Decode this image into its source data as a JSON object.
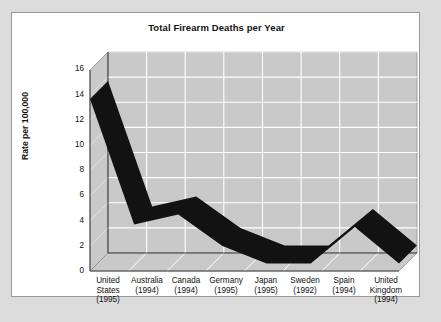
{
  "chart_data": {
    "type": "area",
    "title": "Total Firearm Deaths per Year",
    "subtitle": "",
    "xlabel": "",
    "ylabel": "Rate per 100,000",
    "categories": [
      "United States (1995)",
      "Australia (1994)",
      "Canada (1994)",
      "Germany (1995)",
      "Japan (1995)",
      "Sweden (1992)",
      "Spain (1994)",
      "United Kingdom (1994)"
    ],
    "category_lines": [
      [
        "United",
        "States",
        "(1995)"
      ],
      [
        "Australia",
        "(1994)"
      ],
      [
        "Canada",
        "(1994)"
      ],
      [
        "Germany",
        "(1995)"
      ],
      [
        "Japan",
        "(1995)"
      ],
      [
        "Sweden",
        "(1992)"
      ],
      [
        "Spain",
        "(1994)"
      ],
      [
        "United",
        "Kingdom",
        "(1994)"
      ]
    ],
    "values": [
      13.7,
      3.7,
      4.5,
      2.0,
      0.6,
      0.6,
      3.5,
      0.6
    ],
    "yticks": [
      0,
      2,
      4,
      6,
      8,
      10,
      12,
      14,
      16
    ],
    "ytick_labels": [
      "0",
      "2",
      "4",
      "6",
      "8",
      "10",
      "12",
      "14",
      "16"
    ],
    "ylim": [
      0,
      16
    ],
    "grid": true,
    "legend": "none",
    "style": "3d-ribbon",
    "series_color": "#121212",
    "plot_floor_color": "#c9c9c9",
    "plot_wall_color": "#c9c9c9",
    "gridline_color": "#ffffff",
    "card_color": "#ffffff",
    "page_background": "#dcdcdc"
  },
  "chart": {
    "title": "Total Firearm Deaths per Year",
    "y_axis_title": "Rate per 100,000"
  }
}
